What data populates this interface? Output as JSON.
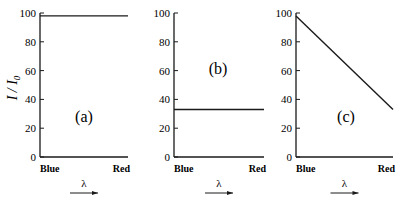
{
  "y_axis_label": "I / I0",
  "chart_data": [
    {
      "type": "line",
      "panel_label": "(a)",
      "xlabel": "λ",
      "ylabel": "I / I0",
      "categories": [
        "Blue",
        "Red"
      ],
      "x": [
        0,
        1
      ],
      "values": [
        98,
        98
      ],
      "ylim": [
        0,
        100
      ],
      "yticks": [
        0,
        20,
        40,
        60,
        80,
        100
      ],
      "grid": false
    },
    {
      "type": "line",
      "panel_label": "(b)",
      "xlabel": "λ",
      "ylabel": "I / I0",
      "categories": [
        "Blue",
        "Red"
      ],
      "x": [
        0,
        1
      ],
      "values": [
        33,
        33
      ],
      "ylim": [
        0,
        100
      ],
      "yticks": [
        0,
        20,
        40,
        60,
        80,
        100
      ],
      "grid": false
    },
    {
      "type": "line",
      "panel_label": "(c)",
      "xlabel": "λ",
      "ylabel": "I / I0",
      "categories": [
        "Blue",
        "Red"
      ],
      "x": [
        0,
        1
      ],
      "values": [
        98,
        33
      ],
      "ylim": [
        0,
        100
      ],
      "yticks": [
        0,
        20,
        40,
        60,
        80,
        100
      ],
      "grid": false
    }
  ]
}
